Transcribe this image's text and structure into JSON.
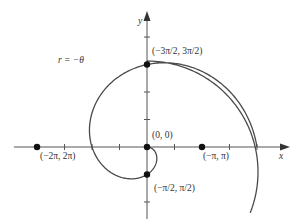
{
  "chart_data": {
    "type": "line",
    "title": "",
    "subtitle": "Polar curve r = -θ (spiral) plotted in Cartesian plane",
    "xlabel": "x",
    "ylabel": "y",
    "grid": false,
    "legend": null,
    "xlim": [
      -6.9,
      4.6
    ],
    "ylim": [
      -4.5,
      7.5
    ],
    "tick_spacing": "π/2",
    "series": [
      {
        "name": "r = -θ",
        "equation": "r = -θ",
        "theta_range": [
          -6.2832,
          0
        ],
        "color": "#444444"
      }
    ],
    "points": [
      {
        "label": "(-3π/2, 3π/2)",
        "x": 0,
        "y": 4.712
      },
      {
        "label": "(-2π, 2π)",
        "x": -6.283,
        "y": 0
      },
      {
        "label": "(0, 0)",
        "x": 0,
        "y": 0
      },
      {
        "label": "(-π, π)",
        "x": 3.142,
        "y": 0
      },
      {
        "label": "(-π/2, π/2)",
        "x": 0,
        "y": -1.571
      }
    ],
    "annotations": [
      {
        "text": "r = −θ",
        "position": "upper-left of curve"
      }
    ]
  },
  "labels": {
    "curve": "r = −θ",
    "x_axis": "x",
    "y_axis": "y",
    "p_top": "(−3π/2, 3π/2)",
    "p_left": "(−2π, 2π)",
    "p_origin": "(0, 0)",
    "p_right": "(−π, π)",
    "p_bottom": "(−π/2, π/2)"
  },
  "colors": {
    "curve": "#4a4a4a",
    "axis": "#555555",
    "point": "#111111"
  }
}
